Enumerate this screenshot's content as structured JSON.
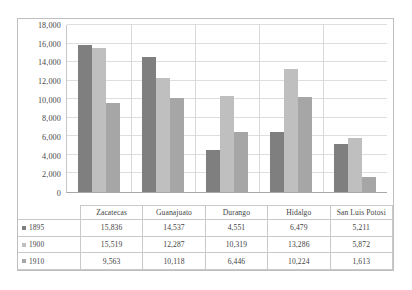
{
  "chart_data": {
    "type": "bar",
    "title": "",
    "xlabel": "",
    "ylabel": "",
    "ylim": [
      0,
      18000
    ],
    "ytick_step": 2000,
    "yticks": [
      "0",
      "2,000",
      "4,000",
      "6,000",
      "8,000",
      "10,000",
      "12,000",
      "14,000",
      "16,000",
      "18,000"
    ],
    "grid": "horizontal",
    "legend_position": "data-table-left",
    "categories": [
      "Zacatecas",
      "Guanajuato",
      "Durango",
      "Hidalgo",
      "San Luis Potosi"
    ],
    "series": [
      {
        "name": "1895",
        "color": "#7f7f7f",
        "values": [
          15836,
          14537,
          4551,
          6479,
          5211
        ],
        "labels": [
          "15,836",
          "14,537",
          "4,551",
          "6,479",
          "5,211"
        ]
      },
      {
        "name": "1900",
        "color": "#bfbfbf",
        "values": [
          15519,
          12287,
          10319,
          13286,
          5872
        ],
        "labels": [
          "15,519",
          "12,287",
          "10,319",
          "13,286",
          "5,872"
        ]
      },
      {
        "name": "1910",
        "color": "#a6a6a6",
        "values": [
          9563,
          10118,
          6446,
          10224,
          1613
        ],
        "labels": [
          "9,563",
          "10,118",
          "6,446",
          "10,224",
          "1,613"
        ]
      }
    ]
  },
  "caption": {
    "text": ""
  }
}
